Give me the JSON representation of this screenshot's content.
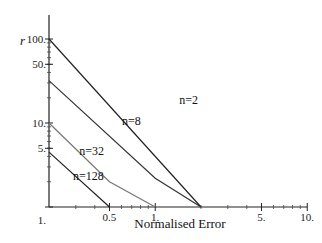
{
  "chart_data": {
    "type": "line",
    "title": "",
    "xlabel": "Normalised Error",
    "ylabel": "r",
    "xscale": "log",
    "yscale": "log",
    "xlim": [
      0.2,
      10
    ],
    "ylim": [
      1,
      100
    ],
    "grid": false,
    "x_ticks": [
      {
        "value": 0.5,
        "label": "0.5"
      },
      {
        "value": 1,
        "label": "1."
      },
      {
        "value": 5,
        "label": "5."
      },
      {
        "value": 10,
        "label": "10."
      }
    ],
    "y_ticks": [
      {
        "value": 1,
        "label": "1."
      },
      {
        "value": 5,
        "label": "5."
      },
      {
        "value": 10,
        "label": "10."
      },
      {
        "value": 50,
        "label": "50."
      },
      {
        "value": 100,
        "label": "100."
      }
    ],
    "series": [
      {
        "name": "n=2",
        "points": [
          [
            0.2,
            100
          ],
          [
            2.0,
            1
          ]
        ],
        "color": "#222222"
      },
      {
        "name": "n=8",
        "points": [
          [
            0.2,
            32
          ],
          [
            1.0,
            2.2
          ],
          [
            2.0,
            1
          ]
        ],
        "color": "#333333"
      },
      {
        "name": "n=32",
        "points": [
          [
            0.2,
            10
          ],
          [
            0.5,
            2.0
          ],
          [
            1.0,
            1
          ]
        ],
        "color": "#777777"
      },
      {
        "name": "n=128",
        "points": [
          [
            0.2,
            4.5
          ],
          [
            0.5,
            1
          ]
        ],
        "color": "#222222"
      }
    ],
    "baseline": {
      "points": [
        [
          0.2,
          1
        ],
        [
          10,
          1
        ]
      ]
    }
  }
}
